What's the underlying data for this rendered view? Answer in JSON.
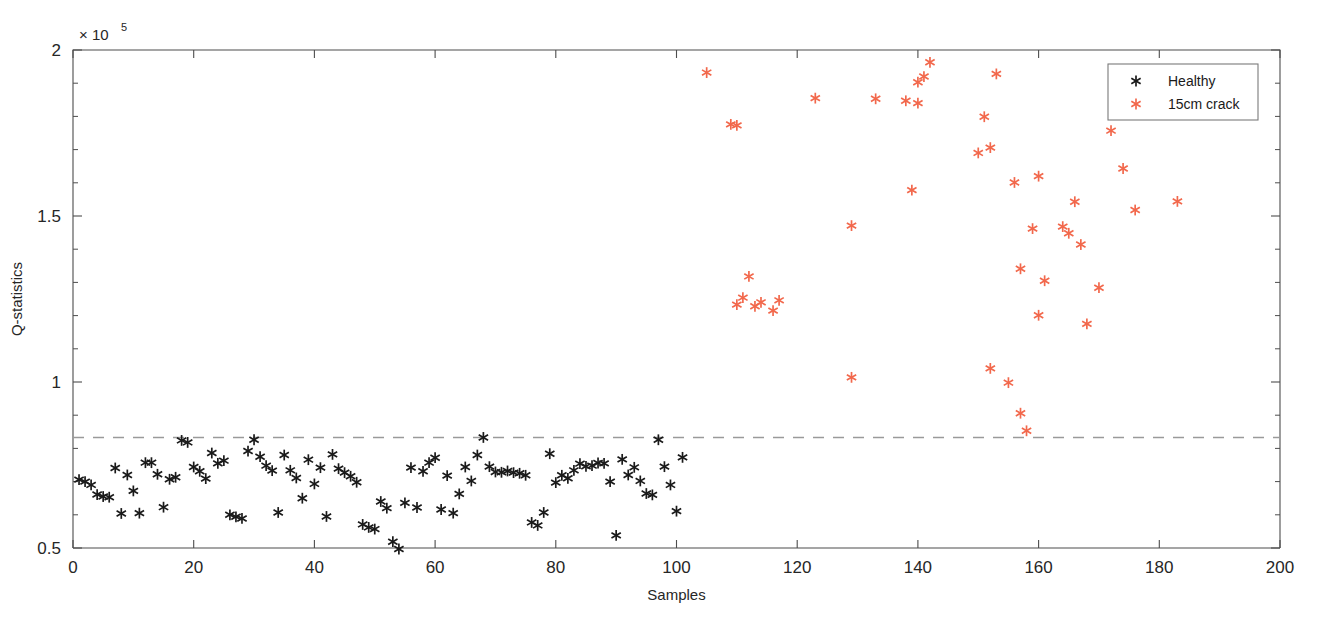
{
  "chart_data": {
    "type": "scatter",
    "title": "",
    "xlabel": "Samples",
    "ylabel": "Q-statistics",
    "y_multiplier": "× 10",
    "y_multiplier_exp": "5",
    "xlim": [
      0,
      200
    ],
    "ylim": [
      0.5,
      2.0
    ],
    "xticks": [
      0,
      20,
      40,
      60,
      80,
      100,
      120,
      140,
      160,
      180,
      200
    ],
    "xticklabels": [
      "0",
      "20",
      "40",
      "60",
      "80",
      "100",
      "120",
      "140",
      "160",
      "180",
      "200"
    ],
    "yticks": [
      0.5,
      1,
      1.5,
      2
    ],
    "yticklabels": [
      "0.5",
      "1",
      "1.5",
      "2"
    ],
    "y_minor_ticks": [
      0.6,
      0.7,
      0.8,
      0.9,
      1.1,
      1.2,
      1.3,
      1.4,
      1.6,
      1.7,
      1.8,
      1.9
    ],
    "grid": false,
    "legend_position": "top-right",
    "threshold": {
      "value": 0.833,
      "style": "dashed",
      "color": "#9a9a9a",
      "label": ""
    },
    "series": [
      {
        "name": "Healthy",
        "color": "#1a1a1a",
        "marker": "asterisk",
        "points": [
          [
            1,
            0.706
          ],
          [
            2,
            0.7
          ],
          [
            3,
            0.69
          ],
          [
            4,
            0.661
          ],
          [
            5,
            0.655
          ],
          [
            6,
            0.653
          ],
          [
            7,
            0.741
          ],
          [
            8,
            0.604
          ],
          [
            9,
            0.72
          ],
          [
            10,
            0.672
          ],
          [
            11,
            0.605
          ],
          [
            12,
            0.757
          ],
          [
            13,
            0.757
          ],
          [
            14,
            0.722
          ],
          [
            15,
            0.623
          ],
          [
            16,
            0.707
          ],
          [
            17,
            0.713
          ],
          [
            18,
            0.824
          ],
          [
            19,
            0.818
          ],
          [
            20,
            0.744
          ],
          [
            21,
            0.731
          ],
          [
            22,
            0.709
          ],
          [
            23,
            0.786
          ],
          [
            24,
            0.755
          ],
          [
            25,
            0.763
          ],
          [
            26,
            0.6
          ],
          [
            27,
            0.594
          ],
          [
            28,
            0.589
          ],
          [
            29,
            0.792
          ],
          [
            30,
            0.826
          ],
          [
            31,
            0.775
          ],
          [
            32,
            0.748
          ],
          [
            33,
            0.733
          ],
          [
            34,
            0.607
          ],
          [
            35,
            0.78
          ],
          [
            36,
            0.734
          ],
          [
            37,
            0.711
          ],
          [
            38,
            0.65
          ],
          [
            39,
            0.766
          ],
          [
            40,
            0.693
          ],
          [
            41,
            0.742
          ],
          [
            42,
            0.595
          ],
          [
            43,
            0.782
          ],
          [
            44,
            0.739
          ],
          [
            45,
            0.727
          ],
          [
            46,
            0.716
          ],
          [
            47,
            0.698
          ],
          [
            48,
            0.571
          ],
          [
            49,
            0.562
          ],
          [
            50,
            0.557
          ],
          [
            51,
            0.64
          ],
          [
            52,
            0.62
          ],
          [
            53,
            0.519
          ],
          [
            54,
            0.497
          ],
          [
            55,
            0.636
          ],
          [
            56,
            0.742
          ],
          [
            57,
            0.622
          ],
          [
            58,
            0.731
          ],
          [
            59,
            0.757
          ],
          [
            60,
            0.772
          ],
          [
            61,
            0.616
          ],
          [
            62,
            0.718
          ],
          [
            63,
            0.605
          ],
          [
            64,
            0.663
          ],
          [
            65,
            0.744
          ],
          [
            66,
            0.702
          ],
          [
            67,
            0.78
          ],
          [
            68,
            0.833
          ],
          [
            69,
            0.745
          ],
          [
            70,
            0.729
          ],
          [
            71,
            0.728
          ],
          [
            72,
            0.732
          ],
          [
            73,
            0.727
          ],
          [
            74,
            0.725
          ],
          [
            75,
            0.719
          ],
          [
            76,
            0.577
          ],
          [
            77,
            0.568
          ],
          [
            78,
            0.607
          ],
          [
            79,
            0.784
          ],
          [
            80,
            0.697
          ],
          [
            81,
            0.719
          ],
          [
            82,
            0.71
          ],
          [
            83,
            0.734
          ],
          [
            84,
            0.754
          ],
          [
            85,
            0.746
          ],
          [
            86,
            0.748
          ],
          [
            87,
            0.756
          ],
          [
            88,
            0.755
          ],
          [
            89,
            0.7
          ],
          [
            90,
            0.538
          ],
          [
            91,
            0.767
          ],
          [
            92,
            0.72
          ],
          [
            93,
            0.743
          ],
          [
            94,
            0.702
          ],
          [
            95,
            0.664
          ],
          [
            96,
            0.66
          ],
          [
            97,
            0.826
          ],
          [
            98,
            0.745
          ],
          [
            99,
            0.69
          ],
          [
            100,
            0.611
          ],
          [
            101,
            0.773
          ]
        ]
      },
      {
        "name": "15cm crack",
        "color": "#f2684c",
        "marker": "asterisk",
        "points": [
          [
            105,
            1.932
          ],
          [
            109,
            1.776
          ],
          [
            110,
            1.773
          ],
          [
            110,
            1.233
          ],
          [
            111,
            1.254
          ],
          [
            112,
            1.318
          ],
          [
            113,
            1.228
          ],
          [
            114,
            1.24
          ],
          [
            116,
            1.215
          ],
          [
            117,
            1.246
          ],
          [
            123,
            1.855
          ],
          [
            129,
            1.471
          ],
          [
            129,
            1.014
          ],
          [
            133,
            1.853
          ],
          [
            138,
            1.847
          ],
          [
            139,
            1.578
          ],
          [
            140,
            1.84
          ],
          [
            140,
            1.903
          ],
          [
            141,
            1.92
          ],
          [
            142,
            1.963
          ],
          [
            150,
            1.69
          ],
          [
            151,
            1.799
          ],
          [
            152,
            1.706
          ],
          [
            152,
            1.041
          ],
          [
            153,
            1.928
          ],
          [
            155,
            0.998
          ],
          [
            156,
            1.601
          ],
          [
            157,
            1.341
          ],
          [
            157,
            0.906
          ],
          [
            158,
            0.853
          ],
          [
            159,
            1.462
          ],
          [
            160,
            1.62
          ],
          [
            160,
            1.201
          ],
          [
            161,
            1.305
          ],
          [
            164,
            1.468
          ],
          [
            165,
            1.448
          ],
          [
            166,
            1.543
          ],
          [
            167,
            1.414
          ],
          [
            168,
            1.175
          ],
          [
            170,
            1.284
          ],
          [
            172,
            1.757
          ],
          [
            174,
            1.643
          ],
          [
            176,
            1.518
          ],
          [
            183,
            1.544
          ]
        ]
      }
    ]
  },
  "legend": {
    "entries": [
      {
        "label": "Healthy",
        "color": "#1a1a1a"
      },
      {
        "label": "15cm crack",
        "color": "#f2684c"
      }
    ]
  }
}
